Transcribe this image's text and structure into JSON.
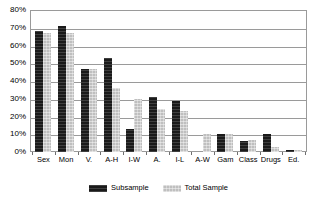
{
  "chart_data": {
    "type": "bar",
    "title": "",
    "xlabel": "",
    "ylabel": "",
    "ylim": [
      0,
      80
    ],
    "ytick_labels": [
      "80%",
      "70%",
      "60%",
      "50%",
      "40%",
      "30%",
      "20%",
      "10%",
      "0%"
    ],
    "ytick_values": [
      80,
      70,
      60,
      50,
      40,
      30,
      20,
      10,
      0
    ],
    "grid": true,
    "legend_position": "bottom",
    "categories": [
      "Sex",
      "Mon",
      "V.",
      "A-H",
      "I-W",
      "A.",
      "I-L",
      "A-W",
      "Gam",
      "Class",
      "Drugs",
      "Ed."
    ],
    "series": [
      {
        "name": "Subsample",
        "color": "#1a1a1a",
        "values": [
          68,
          71,
          47,
          53,
          13,
          31,
          28.5,
          0,
          10,
          6,
          10,
          1
        ]
      },
      {
        "name": "Total Sample",
        "color": "#bfbfbf",
        "values": [
          67,
          67,
          47,
          36,
          30,
          24,
          23,
          10,
          10,
          7,
          3,
          1
        ]
      }
    ]
  },
  "legend": {
    "entries": [
      {
        "label": "Subsample"
      },
      {
        "label": "Total Sample"
      }
    ]
  }
}
